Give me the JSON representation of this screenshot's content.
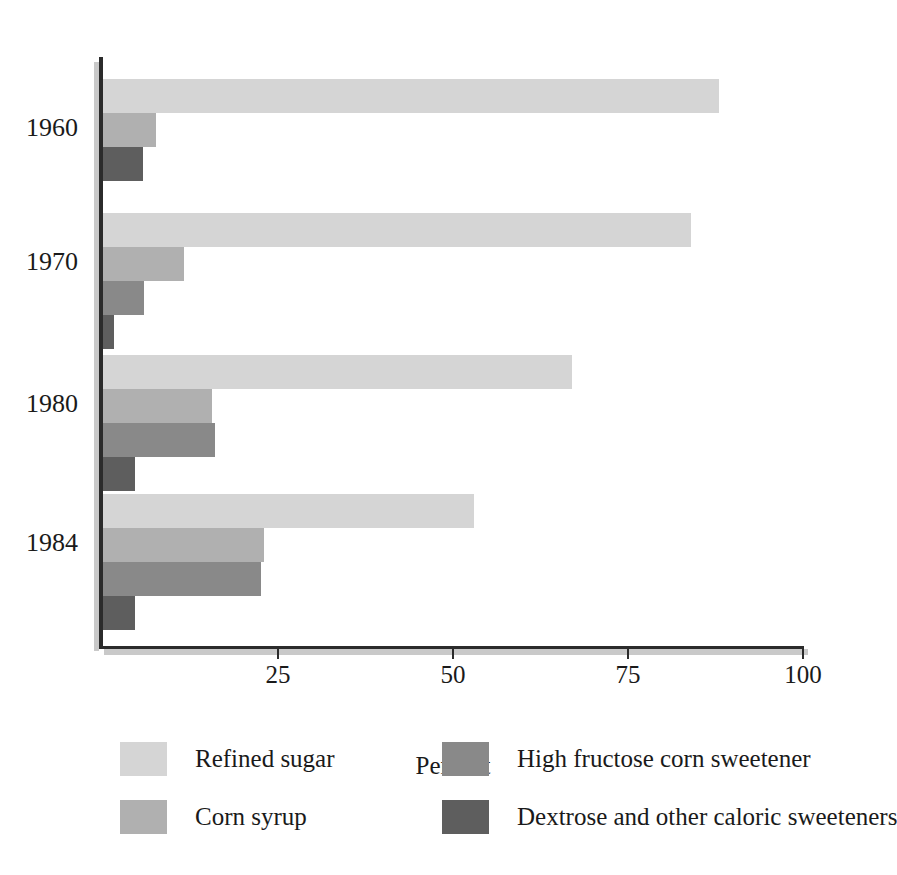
{
  "chart_data": {
    "type": "bar",
    "orientation": "horizontal",
    "title": "",
    "xlabel": "Percent",
    "ylabel": "",
    "categories": [
      "1960",
      "1970",
      "1980",
      "1984"
    ],
    "xlim": [
      0,
      100
    ],
    "xticks": [
      0,
      25,
      50,
      75,
      100
    ],
    "xtick_labels": [
      "",
      "25",
      "50",
      "75",
      "100"
    ],
    "grid": false,
    "legend_position": "bottom",
    "series": [
      {
        "name": "Refined sugar",
        "color": "#d5d5d5",
        "values": [
          88,
          84,
          67,
          53
        ]
      },
      {
        "name": "Corn syrup",
        "color": "#b0b0b0",
        "values": [
          7.5,
          11.5,
          15.5,
          23
        ]
      },
      {
        "name": "High fructose corn sweetener",
        "color": "#898989",
        "values": [
          0,
          5.8,
          16,
          22.5
        ]
      },
      {
        "name": "Dextrose and other caloric sweeteners",
        "color": "#5e5e5e",
        "values": [
          5.7,
          1.5,
          4.6,
          4.6
        ]
      }
    ]
  },
  "axis": {
    "x_title": "Percent",
    "tick_25": "25",
    "tick_50": "50",
    "tick_75": "75",
    "tick_100": "100"
  },
  "years": {
    "y1960": "1960",
    "y1970": "1970",
    "y1980": "1980",
    "y1984": "1984"
  },
  "legend": {
    "items": [
      {
        "label": "Refined sugar",
        "color": "#d5d5d5"
      },
      {
        "label": "Corn syrup",
        "color": "#b0b0b0"
      },
      {
        "label": "High fructose corn sweetener",
        "color": "#898989"
      },
      {
        "label": "Dextrose and other caloric sweeteners",
        "color": "#5e5e5e"
      }
    ]
  },
  "colors": {
    "refined_sugar": "#d5d5d5",
    "corn_syrup": "#b0b0b0",
    "hfcs": "#898989",
    "dextrose": "#5e5e5e",
    "axis": "#2b2b2b",
    "axis_shadow": "#c9c9c9",
    "background": "#ffffff",
    "text": "#1a1a1a"
  }
}
